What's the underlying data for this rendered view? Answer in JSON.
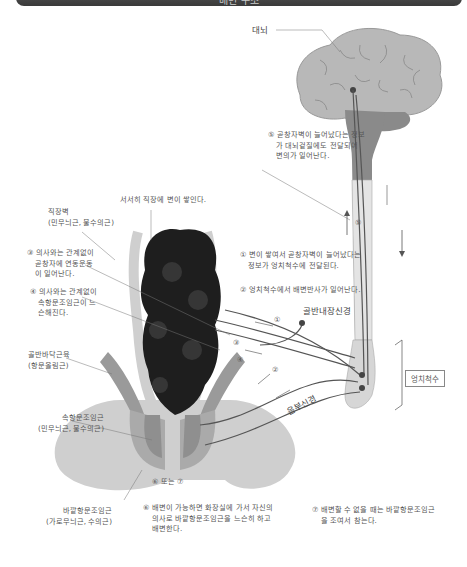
{
  "title": "배변 구조",
  "labels": {
    "cerebrum": "대뇌",
    "step5": [
      "⑤ 곧창자벽이 늘어났다는 정보",
      "가 대뇌겉질에도 전달되어",
      "변의가 일어난다."
    ],
    "stool_accumulates": "서서히 직장에 변이 쌓인다.",
    "rectal_wall": [
      "직장벽",
      "(민무늬근, 불수의근)"
    ],
    "step3": [
      "③ 의사와는 관계없이",
      "곧창자에 연동운동",
      "이 일어난다."
    ],
    "step4": [
      "④ 의사와는 관계없이",
      "속항문조임근이 느",
      "슨해진다."
    ],
    "step1": [
      "① 변이 쌓여서 곧창자벽이 늘어났다는",
      "정보가 엉치척수에 전달된다."
    ],
    "step2": "② 엉치척수에서 배변반사가 일어난다.",
    "pelvic_splanchnic_nerve": "골반내장신경",
    "sacral_spinal_cord": "엉치척수",
    "pudendal_nerve": "음부신경",
    "pelvic_floor_muscle": [
      "골반바닥근육",
      "(항문올림근)"
    ],
    "internal_anal_sphincter": [
      "속항문조임근",
      "(민무늬근, 불수의근)"
    ],
    "step6or7": "⑥ 또는 ⑦",
    "external_anal_sphincter": [
      "바깥항문조임근",
      "(가로무늬근, 수의근)"
    ],
    "step6": [
      "⑥ 배변이 가능하면 화장실에 가서 자신의",
      "의사로 바깥항문조임근을 느슨히 하고",
      "배변한다."
    ],
    "step7": [
      "⑦ 배변할 수 없을 때는 바깥항문조임근",
      "을 조여서 참는다."
    ],
    "markers": {
      "m1": "①",
      "m2": "②",
      "m3": "③",
      "m4": "④",
      "m5": "⑤"
    }
  },
  "colors": {
    "brain": "#b8b8b8",
    "brainstem": "#8a8a8a",
    "spinal": "#e4e4e4",
    "rectum": "#1e1e1e",
    "muscle_light": "#cfcfcf",
    "muscle_dark": "#9a9a9a",
    "nerve": "#555555"
  }
}
